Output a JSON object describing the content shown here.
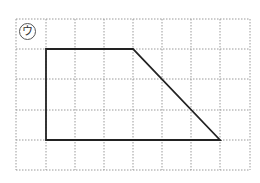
{
  "figure": {
    "label": "ウ",
    "grid": {
      "columns": 8,
      "rows": 5,
      "x_lines": [
        16,
        46,
        75,
        104,
        133,
        162,
        191,
        220,
        250
      ],
      "y_lines": [
        19,
        49,
        79,
        110,
        140,
        170
      ],
      "line_color": "#9a9a9a",
      "style": "dotted"
    },
    "shape": {
      "type": "trapezoid",
      "stroke_color": "#222222",
      "vertices_grid": [
        [
          1,
          1
        ],
        [
          4,
          1
        ],
        [
          7,
          4
        ],
        [
          1,
          4
        ]
      ],
      "points": "46,49 133,49 220,140 46,140"
    }
  }
}
